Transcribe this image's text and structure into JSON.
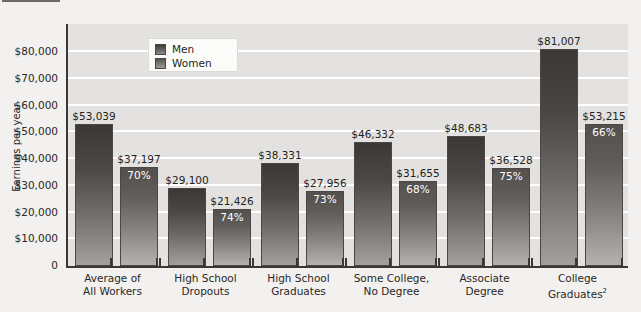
{
  "figure": {
    "title_visible_fragment": "",
    "legend": {
      "position": "inside-top-left",
      "men_label": "Men",
      "women_label": "Women"
    }
  },
  "axis": {
    "ylabel": "Earnings per year",
    "yticks": [
      "$80,000",
      "$70,000",
      "$60,000",
      "$50,000",
      "$40,000",
      "$30,000",
      "$20,000",
      "$10,000",
      "0"
    ]
  },
  "colors": {
    "plot_background": "#e3e2e0",
    "page_background": "#f2f1ef",
    "gridline": "#ffffff",
    "axis": "#3a3734",
    "men_bar": "#3b3836",
    "women_bar": "#56534f",
    "value_label": "#231f20",
    "pct_label": "#ffffff"
  },
  "chart_data": {
    "type": "bar",
    "title": "",
    "xlabel": "",
    "ylabel": "Earnings per year",
    "ylim": [
      0,
      80000
    ],
    "ytick_values": [
      0,
      10000,
      20000,
      30000,
      40000,
      50000,
      60000,
      70000,
      80000
    ],
    "grid": true,
    "legend_position": "upper left inside",
    "categories": [
      "Average of All Workers",
      "High School Dropouts",
      "High School Graduates",
      "Some College, No Degree",
      "Associate Degree",
      "College Graduates"
    ],
    "category_lines": [
      [
        "Average of",
        "All Workers"
      ],
      [
        "High School",
        "Dropouts"
      ],
      [
        "High School",
        "Graduates"
      ],
      [
        "Some College,",
        "No Degree"
      ],
      [
        "Associate",
        "Degree"
      ],
      [
        "College",
        "Graduates"
      ]
    ],
    "category_footnotes": [
      "",
      "",
      "",
      "",
      "",
      "2"
    ],
    "series": [
      {
        "name": "Men",
        "values": [
          53039,
          29100,
          38331,
          46332,
          48683,
          81007
        ],
        "labels": [
          "$53,039",
          "$29,100",
          "$38,331",
          "$46,332",
          "$48,683",
          "$81,007"
        ]
      },
      {
        "name": "Women",
        "values": [
          37197,
          21426,
          27956,
          31655,
          36528,
          53215
        ],
        "labels": [
          "$37,197",
          "$21,426",
          "$27,956",
          "$31,655",
          "$36,528",
          "$53,215"
        ],
        "pct_of_men": [
          "70%",
          "74%",
          "73%",
          "68%",
          "75%",
          "66%"
        ]
      }
    ]
  }
}
